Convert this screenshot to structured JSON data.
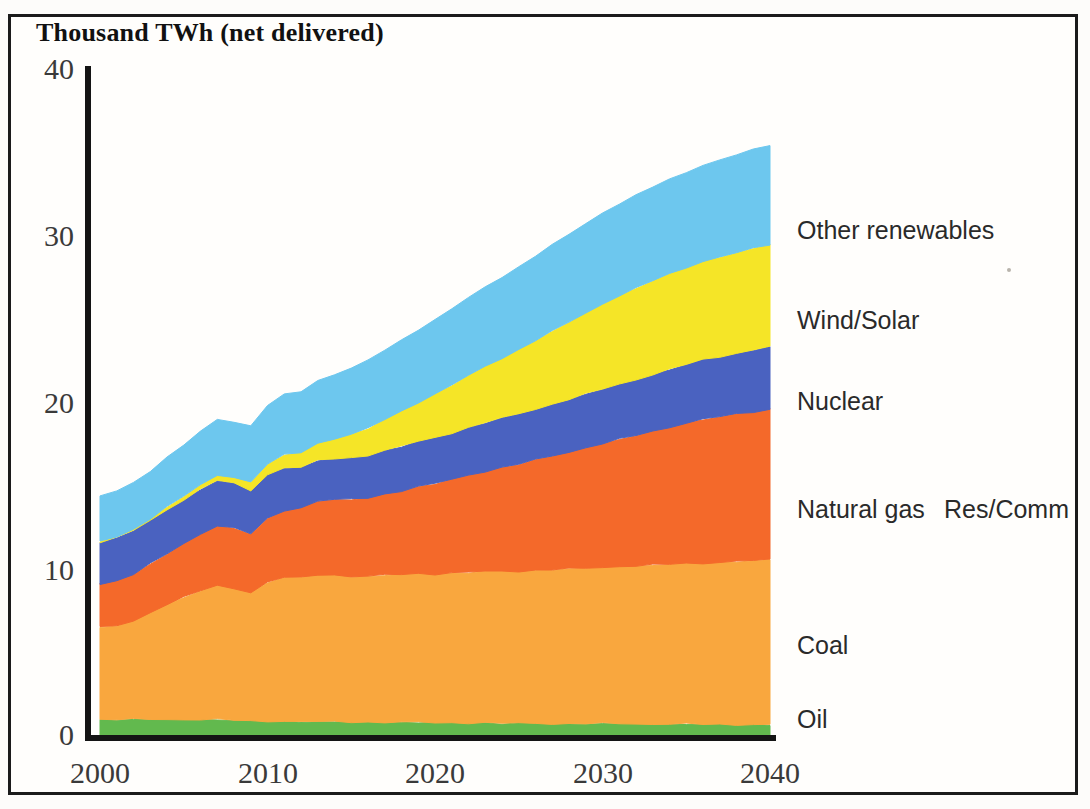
{
  "title": "Thousand TWh (net delivered)",
  "axes": {
    "y_ticks": [
      "0",
      "10",
      "20",
      "30",
      "40"
    ],
    "x_ticks": [
      "2000",
      "2010",
      "2020",
      "2030",
      "2040"
    ]
  },
  "legend": {
    "other_renewables": "Other renewables",
    "wind_solar": "Wind/Solar",
    "nuclear": "Nuclear",
    "natural_gas": "Natural gas",
    "res_comm": "Res/Comm",
    "coal": "Coal",
    "oil": "Oil"
  },
  "chart_data": {
    "type": "area",
    "title": "Thousand TWh (net delivered)",
    "xlabel": "",
    "ylabel": "Thousand TWh (net delivered)",
    "xlim": [
      2000,
      2040
    ],
    "ylim": [
      0,
      40
    ],
    "ytick_values": [
      0,
      10,
      20,
      30,
      40
    ],
    "xtick_values": [
      2000,
      2010,
      2020,
      2030,
      2040
    ],
    "grid": false,
    "stacked": true,
    "legend_position": "right-inline-at-band",
    "x": [
      2000,
      2001,
      2002,
      2003,
      2004,
      2005,
      2006,
      2007,
      2008,
      2009,
      2010,
      2011,
      2012,
      2013,
      2014,
      2015,
      2016,
      2017,
      2018,
      2019,
      2020,
      2021,
      2022,
      2023,
      2024,
      2025,
      2026,
      2027,
      2028,
      2029,
      2030,
      2031,
      2032,
      2033,
      2034,
      2035,
      2036,
      2037,
      2038,
      2039,
      2040
    ],
    "series": [
      {
        "name": "Oil",
        "color": "#62b94e",
        "values": [
          1.05,
          1.05,
          1.05,
          1.05,
          1.05,
          1.05,
          1.05,
          1.05,
          1.0,
          0.95,
          0.95,
          0.95,
          0.92,
          0.92,
          0.9,
          0.9,
          0.9,
          0.88,
          0.88,
          0.88,
          0.85,
          0.85,
          0.85,
          0.85,
          0.82,
          0.82,
          0.82,
          0.8,
          0.8,
          0.8,
          0.8,
          0.8,
          0.78,
          0.78,
          0.78,
          0.78,
          0.75,
          0.75,
          0.75,
          0.75,
          0.75
        ]
      },
      {
        "name": "Coal",
        "color": "#f9a73e",
        "values": [
          5.5,
          5.6,
          5.9,
          6.4,
          6.9,
          7.3,
          7.7,
          8.0,
          7.9,
          7.7,
          8.3,
          8.6,
          8.6,
          8.8,
          8.8,
          8.7,
          8.7,
          8.8,
          8.85,
          8.9,
          8.9,
          8.95,
          9.0,
          9.05,
          9.1,
          9.1,
          9.15,
          9.2,
          9.25,
          9.3,
          9.35,
          9.4,
          9.45,
          9.5,
          9.55,
          9.6,
          9.65,
          9.7,
          9.75,
          9.8,
          9.85
        ]
      },
      {
        "name": "Natural gas",
        "color": "#f4692a",
        "values": [
          2.6,
          2.7,
          2.8,
          2.9,
          3.0,
          3.2,
          3.4,
          3.6,
          3.6,
          3.5,
          3.8,
          4.0,
          4.2,
          4.4,
          4.5,
          4.6,
          4.7,
          4.85,
          5.0,
          5.2,
          5.4,
          5.6,
          5.8,
          6.0,
          6.2,
          6.4,
          6.6,
          6.8,
          7.0,
          7.2,
          7.4,
          7.6,
          7.8,
          8.0,
          8.2,
          8.4,
          8.6,
          8.7,
          8.8,
          8.9,
          9.0
        ]
      },
      {
        "name": "Nuclear",
        "color": "#4a62c0",
        "values": [
          2.5,
          2.55,
          2.6,
          2.6,
          2.65,
          2.65,
          2.65,
          2.7,
          2.65,
          2.6,
          2.65,
          2.55,
          2.4,
          2.4,
          2.45,
          2.5,
          2.55,
          2.6,
          2.65,
          2.7,
          2.75,
          2.8,
          2.85,
          2.9,
          2.95,
          3.0,
          3.05,
          3.1,
          3.15,
          3.2,
          3.25,
          3.3,
          3.35,
          3.4,
          3.45,
          3.5,
          3.55,
          3.6,
          3.65,
          3.7,
          3.75
        ]
      },
      {
        "name": "Wind/Solar",
        "color": "#f5e527",
        "values": [
          0.05,
          0.07,
          0.09,
          0.12,
          0.15,
          0.2,
          0.25,
          0.32,
          0.4,
          0.5,
          0.62,
          0.75,
          0.9,
          1.05,
          1.2,
          1.4,
          1.6,
          1.85,
          2.1,
          2.35,
          2.6,
          2.85,
          3.1,
          3.35,
          3.6,
          3.85,
          4.1,
          4.35,
          4.6,
          4.85,
          5.1,
          5.3,
          5.45,
          5.6,
          5.7,
          5.8,
          5.9,
          5.95,
          6.0,
          6.05,
          6.1
        ]
      },
      {
        "name": "Other renewables",
        "color": "#6dc7ee",
        "values": [
          2.7,
          2.75,
          2.8,
          2.85,
          2.95,
          3.05,
          3.2,
          3.35,
          3.3,
          3.35,
          3.5,
          3.6,
          3.65,
          3.75,
          3.85,
          3.95,
          4.05,
          4.15,
          4.25,
          4.35,
          4.45,
          4.55,
          4.65,
          4.75,
          4.85,
          4.95,
          5.05,
          5.15,
          5.25,
          5.35,
          5.45,
          5.5,
          5.55,
          5.6,
          5.65,
          5.7,
          5.75,
          5.8,
          5.85,
          5.9,
          5.95
        ]
      }
    ]
  }
}
